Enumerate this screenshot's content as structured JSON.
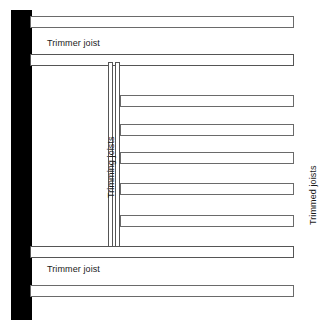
{
  "diagram": {
    "background_color": "#ffffff",
    "wall": {
      "name": "supporting-wall",
      "color": "#000000",
      "x": 11,
      "y": 10,
      "width": 21,
      "height": 310
    },
    "labels": [
      {
        "id": "trimmer-joist-top",
        "text": "Trimmer joist",
        "orientation": "horizontal",
        "x": 47,
        "y": 39,
        "font_size": 9
      },
      {
        "id": "trimming-joists",
        "text": "Trimming joists",
        "orientation": "vertical",
        "x": 107,
        "y": 198,
        "font_size": 9
      },
      {
        "id": "trimmed-joists",
        "text": "Trimmed joists",
        "orientation": "vertical",
        "x": 309,
        "y": 225,
        "font_size": 9
      },
      {
        "id": "trimmer-joist-bottom",
        "text": "Trimmer joist",
        "orientation": "horizontal",
        "x": 47,
        "y": 265,
        "font_size": 9
      }
    ],
    "members": [
      {
        "id": "joist-full-top",
        "role": "trimmed-joist",
        "orientation": "horizontal",
        "weight": "normal",
        "x": 30,
        "y": 16,
        "width": 264,
        "height": 12
      },
      {
        "id": "trimmer-joist-upper",
        "role": "trimmer-joist",
        "orientation": "horizontal",
        "weight": "heavy",
        "x": 30,
        "y": 54,
        "width": 264,
        "height": 12
      },
      {
        "id": "trimming-joist-left",
        "role": "trimming-joist",
        "orientation": "vertical",
        "weight": "heavy",
        "x": 108,
        "y": 62,
        "width": 5,
        "height": 186
      },
      {
        "id": "trimming-joist-right",
        "role": "trimming-joist",
        "orientation": "vertical",
        "weight": "heavy",
        "x": 115,
        "y": 62,
        "width": 5,
        "height": 186
      },
      {
        "id": "trimmed-joist-1",
        "role": "trimmed-joist",
        "orientation": "horizontal",
        "weight": "normal",
        "x": 120,
        "y": 95,
        "width": 174,
        "height": 12
      },
      {
        "id": "trimmed-joist-2",
        "role": "trimmed-joist",
        "orientation": "horizontal",
        "weight": "normal",
        "x": 120,
        "y": 124,
        "width": 174,
        "height": 12
      },
      {
        "id": "trimmed-joist-3",
        "role": "trimmed-joist",
        "orientation": "horizontal",
        "weight": "normal",
        "x": 120,
        "y": 152,
        "width": 174,
        "height": 12
      },
      {
        "id": "trimmed-joist-4",
        "role": "trimmed-joist",
        "orientation": "horizontal",
        "weight": "normal",
        "x": 120,
        "y": 183,
        "width": 174,
        "height": 12
      },
      {
        "id": "trimmed-joist-5",
        "role": "trimmed-joist",
        "orientation": "horizontal",
        "weight": "normal",
        "x": 120,
        "y": 215,
        "width": 174,
        "height": 12
      },
      {
        "id": "trimmer-joist-lower",
        "role": "trimmer-joist",
        "orientation": "horizontal",
        "weight": "heavy",
        "x": 30,
        "y": 246,
        "width": 264,
        "height": 12
      },
      {
        "id": "joist-full-bottom",
        "role": "trimmed-joist",
        "orientation": "horizontal",
        "weight": "normal",
        "x": 30,
        "y": 285,
        "width": 264,
        "height": 12
      }
    ]
  }
}
